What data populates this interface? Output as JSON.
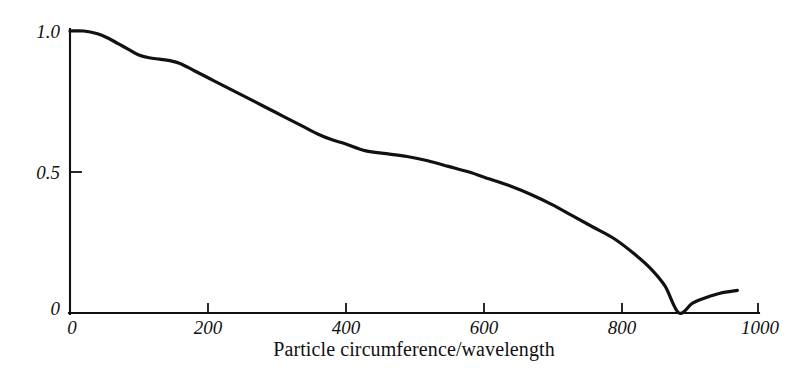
{
  "chart_data": {
    "type": "line",
    "title": "",
    "subtitle": "",
    "xlabel": "Particle circumference/wavelength",
    "ylabel": "Visibility",
    "xlim": [
      0,
      1000
    ],
    "ylim": [
      0,
      1.0
    ],
    "grid": false,
    "legend": "none",
    "x_ticks": [
      0,
      200,
      400,
      600,
      800,
      1000
    ],
    "x_tick_labels": [
      "0",
      "200",
      "400",
      "600",
      "800",
      "1000"
    ],
    "y_ticks": [
      0,
      0.5,
      1.0
    ],
    "y_tick_labels": [
      "0",
      "0.5",
      "1.0"
    ],
    "line_color": "#111111",
    "series": [
      {
        "name": "Visibility",
        "x": [
          0,
          20,
          40,
          55,
          70,
          85,
          100,
          115,
          130,
          145,
          160,
          180,
          200,
          220,
          240,
          260,
          280,
          300,
          320,
          340,
          360,
          380,
          400,
          430,
          460,
          490,
          520,
          550,
          580,
          610,
          640,
          670,
          700,
          730,
          760,
          790,
          820,
          845,
          865,
          885,
          905,
          925,
          945,
          970
        ],
        "y": [
          1.0,
          1.0,
          0.99,
          0.975,
          0.955,
          0.935,
          0.915,
          0.905,
          0.9,
          0.895,
          0.885,
          0.86,
          0.835,
          0.81,
          0.785,
          0.76,
          0.735,
          0.71,
          0.685,
          0.66,
          0.635,
          0.615,
          0.6,
          0.575,
          0.565,
          0.555,
          0.54,
          0.52,
          0.5,
          0.475,
          0.45,
          0.42,
          0.385,
          0.345,
          0.305,
          0.265,
          0.21,
          0.155,
          0.095,
          0.0,
          0.035,
          0.055,
          0.07,
          0.08
        ]
      }
    ],
    "annotations": {
      "zero_crossing_x": 885,
      "final_value": 0.08
    }
  },
  "axes": {
    "x_title": "Particle circumference/wavelength",
    "y_title": "Visibility"
  }
}
